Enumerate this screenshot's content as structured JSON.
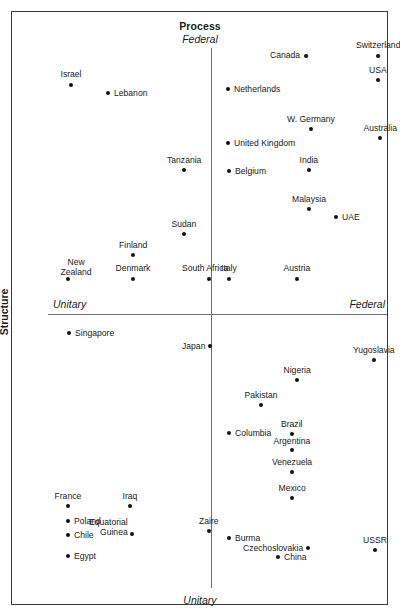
{
  "chart_data": {
    "type": "scatter",
    "title": "Process",
    "xlabel": "Process",
    "ylabel": "Structure",
    "axes": {
      "x_axis_name": "Structure",
      "x_left_label": "Unitary",
      "x_right_label": "Federal",
      "y_axis_name": "Process",
      "y_top_label": "Federal",
      "y_bottom_label": "Unitary"
    },
    "grid": false,
    "legend": "none",
    "xlim": [
      0,
      1
    ],
    "ylim": [
      0,
      1
    ],
    "points": [
      {
        "label": "Israel",
        "px": 71,
        "py": 85,
        "lx": 71,
        "ly": 70,
        "align": "c"
      },
      {
        "label": "Lebanon",
        "px": 108,
        "py": 93,
        "lx": 114,
        "ly": 89,
        "align": "l"
      },
      {
        "label": "Canada",
        "px": 306,
        "py": 56,
        "lx": 300,
        "ly": 51,
        "align": "r"
      },
      {
        "label": "Switzerland",
        "px": 378,
        "py": 56,
        "lx": 378,
        "ly": 41,
        "align": "c"
      },
      {
        "label": "USA",
        "px": 378,
        "py": 80,
        "lx": 378,
        "ly": 66,
        "align": "c"
      },
      {
        "label": "Netherlands",
        "px": 228,
        "py": 89,
        "lx": 234,
        "ly": 85,
        "align": "l"
      },
      {
        "label": "W. Germany",
        "px": 311,
        "py": 129,
        "lx": 311,
        "ly": 115,
        "align": "c"
      },
      {
        "label": "Australia",
        "px": 380,
        "py": 138,
        "lx": 380,
        "ly": 124,
        "align": "c"
      },
      {
        "label": "United Kingdom",
        "px": 228,
        "py": 143,
        "lx": 234,
        "ly": 139,
        "align": "l"
      },
      {
        "label": "Tanzania",
        "px": 184,
        "py": 170,
        "lx": 184,
        "ly": 156,
        "align": "c"
      },
      {
        "label": "Belgium",
        "px": 229,
        "py": 171,
        "lx": 235,
        "ly": 167,
        "align": "l"
      },
      {
        "label": "India",
        "px": 309,
        "py": 170,
        "lx": 309,
        "ly": 156,
        "align": "c"
      },
      {
        "label": "Malaysia",
        "px": 309,
        "py": 209,
        "lx": 309,
        "ly": 195,
        "align": "c"
      },
      {
        "label": "UAE",
        "px": 336,
        "py": 217,
        "lx": 342,
        "ly": 213,
        "align": "l"
      },
      {
        "label": "Sudan",
        "px": 184,
        "py": 234,
        "lx": 184,
        "ly": 220,
        "align": "c"
      },
      {
        "label": "Finland",
        "px": 133,
        "py": 255,
        "lx": 133,
        "ly": 241,
        "align": "c"
      },
      {
        "label": "New\nZealand",
        "px": 68,
        "py": 279,
        "lx": 76,
        "ly": 258,
        "align": "c"
      },
      {
        "label": "Denmark",
        "px": 133,
        "py": 279,
        "lx": 133,
        "ly": 264,
        "align": "c"
      },
      {
        "label": "South Africa",
        "px": 209,
        "py": 279,
        "lx": 205,
        "ly": 264,
        "align": "c"
      },
      {
        "label": "Italy",
        "px": 229,
        "py": 279,
        "lx": 229,
        "ly": 264,
        "align": "c"
      },
      {
        "label": "Austria",
        "px": 297,
        "py": 279,
        "lx": 297,
        "ly": 264,
        "align": "c"
      },
      {
        "label": "Singapore",
        "px": 69,
        "py": 333,
        "lx": 75,
        "ly": 329,
        "align": "l"
      },
      {
        "label": "Japan",
        "px": 210,
        "py": 346,
        "lx": 205,
        "ly": 342,
        "align": "r"
      },
      {
        "label": "Yugoslavia",
        "px": 374,
        "py": 360,
        "lx": 374,
        "ly": 346,
        "align": "c"
      },
      {
        "label": "Nigeria",
        "px": 297,
        "py": 380,
        "lx": 297,
        "ly": 366,
        "align": "c"
      },
      {
        "label": "Pakistan",
        "px": 261,
        "py": 405,
        "lx": 261,
        "ly": 391,
        "align": "c"
      },
      {
        "label": "Brazil",
        "px": 292,
        "py": 434,
        "lx": 292,
        "ly": 420,
        "align": "c"
      },
      {
        "label": "Columbia",
        "px": 229,
        "py": 433,
        "lx": 235,
        "ly": 429,
        "align": "l"
      },
      {
        "label": "Argentina",
        "px": 292,
        "py": 450,
        "lx": 292,
        "ly": 437,
        "align": "c"
      },
      {
        "label": "Venezuela",
        "px": 292,
        "py": 472,
        "lx": 292,
        "ly": 458,
        "align": "c"
      },
      {
        "label": "Mexico",
        "px": 292,
        "py": 498,
        "lx": 292,
        "ly": 484,
        "align": "c"
      },
      {
        "label": "France",
        "px": 68,
        "py": 506,
        "lx": 68,
        "ly": 492,
        "align": "c"
      },
      {
        "label": "Iraq",
        "px": 130,
        "py": 506,
        "lx": 130,
        "ly": 492,
        "align": "c"
      },
      {
        "label": "Poland",
        "px": 68,
        "py": 521,
        "lx": 74,
        "ly": 517,
        "align": "l"
      },
      {
        "label": "Chile",
        "px": 68,
        "py": 535,
        "lx": 74,
        "ly": 531,
        "align": "l"
      },
      {
        "label": "Equatorial\nGuinea",
        "px": 132,
        "py": 534,
        "lx": 128,
        "ly": 518,
        "align": "r"
      },
      {
        "label": "Zaire",
        "px": 209,
        "py": 531,
        "lx": 209,
        "ly": 517,
        "align": "c"
      },
      {
        "label": "Burma",
        "px": 229,
        "py": 538,
        "lx": 235,
        "ly": 534,
        "align": "l"
      },
      {
        "label": "Czechoslovakia",
        "px": 308,
        "py": 548,
        "lx": 303,
        "ly": 544,
        "align": "r"
      },
      {
        "label": "China",
        "px": 278,
        "py": 557,
        "lx": 284,
        "ly": 553,
        "align": "l"
      },
      {
        "label": "USSR",
        "px": 375,
        "py": 550,
        "lx": 375,
        "ly": 536,
        "align": "c"
      },
      {
        "label": "Egypt",
        "px": 68,
        "py": 556,
        "lx": 74,
        "ly": 552,
        "align": "l"
      }
    ]
  },
  "colors": {
    "point": "#111111",
    "axis": "#6e6e6e",
    "frame": "#3b3b3b",
    "text": "#1a1a1a"
  }
}
